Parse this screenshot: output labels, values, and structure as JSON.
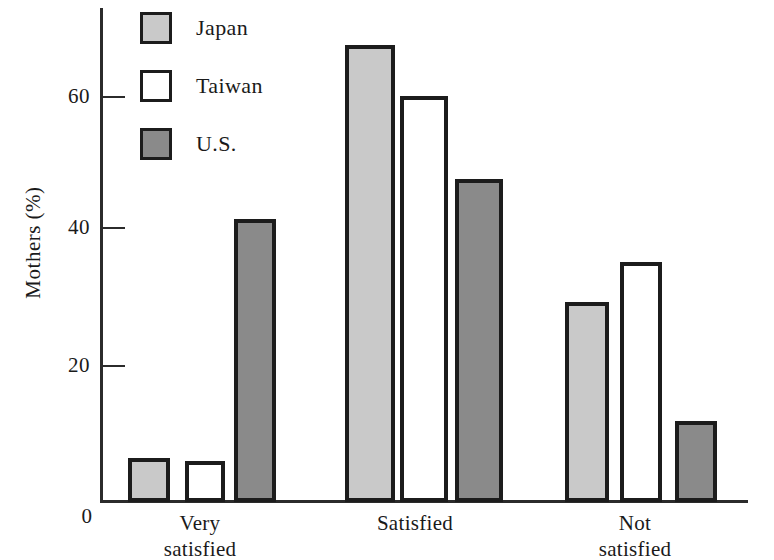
{
  "chart_data": {
    "type": "bar",
    "title": "",
    "xlabel": "",
    "ylabel": "Mothers (%)",
    "categories": [
      "Very satisfied",
      "Satisfied",
      "Not satisfied"
    ],
    "category_lines": [
      [
        "Very",
        "satisfied"
      ],
      [
        "Satisfied"
      ],
      [
        "Not",
        "satisfied"
      ]
    ],
    "series": [
      {
        "name": "Japan",
        "color": "#c9c9c9",
        "values": [
          6.5,
          67.5,
          29.5
        ]
      },
      {
        "name": "Taiwan",
        "color": "#ffffff",
        "values": [
          6.0,
          60.0,
          35.5
        ]
      },
      {
        "name": "U.S.",
        "color": "#8a8a8a",
        "values": [
          41.8,
          47.8,
          12.0
        ]
      }
    ],
    "ylim": [
      0,
      72
    ],
    "yticks": [
      0,
      20,
      40,
      60
    ],
    "ytick_labels": [
      "0",
      "20",
      "40",
      "60"
    ],
    "grid": false,
    "legend_position": "top-left",
    "legend_entries": [
      "Japan",
      "Taiwan",
      "U.S."
    ]
  },
  "axes": {
    "y_title": "Mothers (%)",
    "zero_label": "0",
    "tick_labels": [
      "20",
      "40",
      "60"
    ]
  },
  "legend": {
    "items": [
      {
        "label": "Japan",
        "swatch": "legend-swatch-japan"
      },
      {
        "label": "Taiwan",
        "swatch": "legend-swatch-taiwan"
      },
      {
        "label": "U.S.",
        "swatch": "legend-swatch-us"
      }
    ]
  },
  "categories": [
    {
      "line1": "Very",
      "line2": "satisfied"
    },
    {
      "line1": "Satisfied",
      "line2": ""
    },
    {
      "line1": "Not",
      "line2": "satisfied"
    }
  ]
}
